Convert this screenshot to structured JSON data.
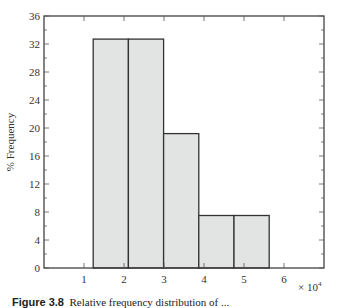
{
  "chart_data": {
    "type": "bar",
    "title": "",
    "xlabel": "",
    "ylabel": "% Frequency",
    "x_multiplier": "× 10^4",
    "xlim": [
      0,
      7
    ],
    "ylim": [
      0,
      36
    ],
    "xticks": [
      1,
      2,
      3,
      4,
      5,
      6
    ],
    "yticks": [
      0,
      4,
      8,
      12,
      16,
      20,
      24,
      28,
      32,
      36
    ],
    "grid": false,
    "bins": [
      {
        "left": 1.23,
        "right": 2.11,
        "value": 32.7
      },
      {
        "left": 2.11,
        "right": 2.99,
        "value": 32.7
      },
      {
        "left": 2.99,
        "right": 3.87,
        "value": 19.2
      },
      {
        "left": 3.87,
        "right": 4.75,
        "value": 7.5
      },
      {
        "left": 4.75,
        "right": 5.63,
        "value": 7.5
      }
    ],
    "bar_color": "#e2e4e4",
    "edge_color": "#333333"
  },
  "labels": {
    "ylabel": "% Frequency",
    "multiplier_base": "× 10",
    "multiplier_exp": "4",
    "caption_prefix": "Figure 3.8",
    "caption_text": "Relative frequency distribution of ..."
  }
}
